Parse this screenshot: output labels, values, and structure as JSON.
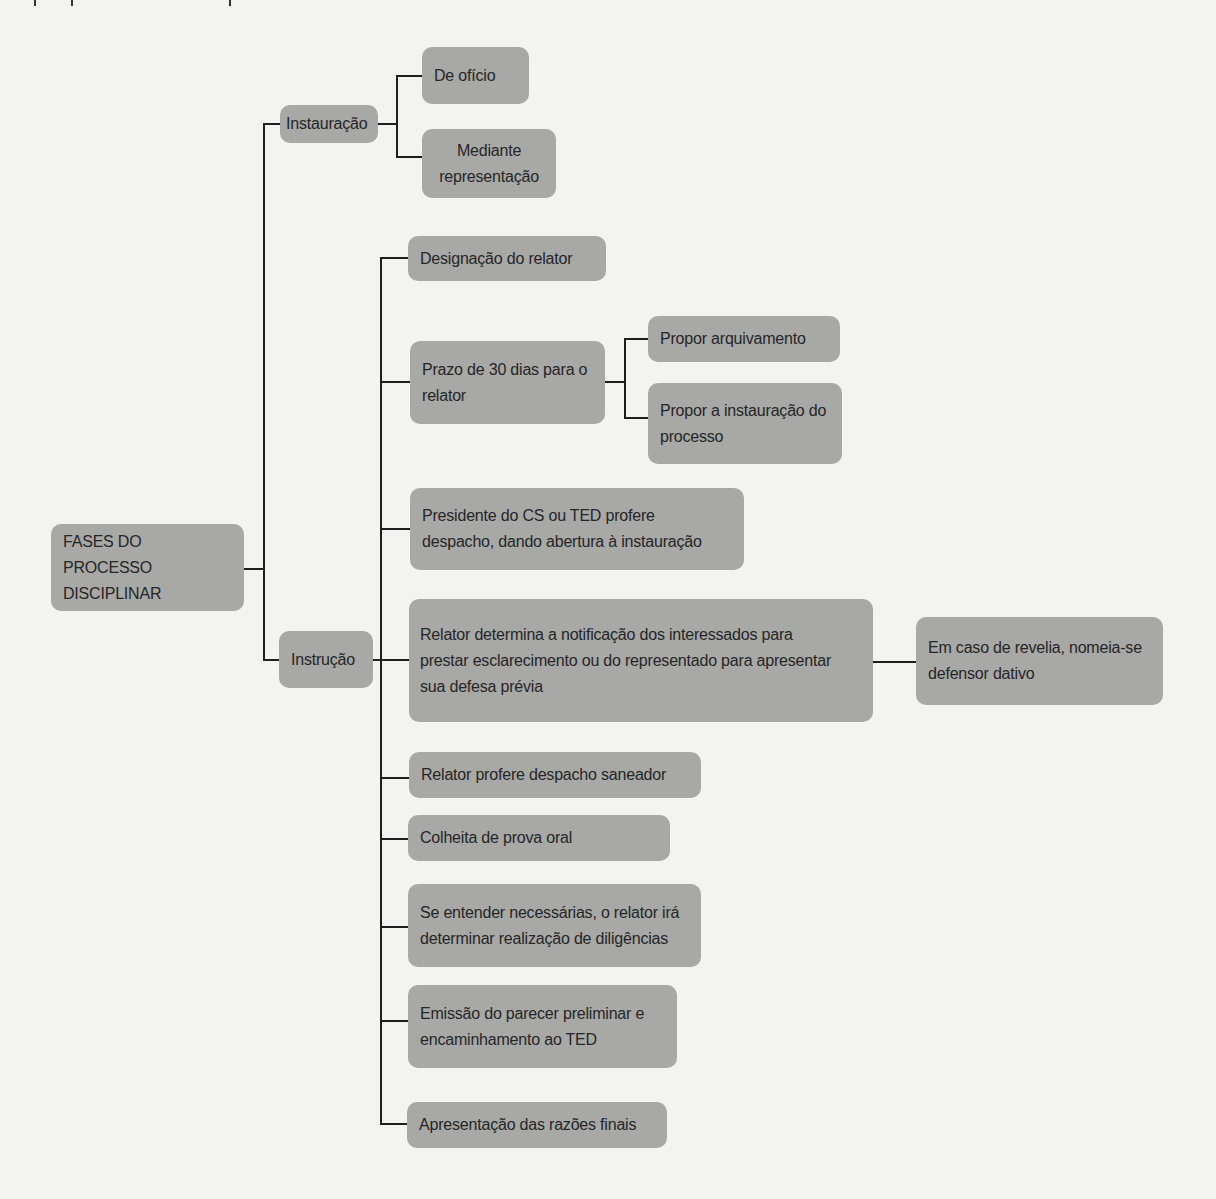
{
  "diagram": {
    "root": {
      "label": "FASES DO PROCESSO DISCIPLINAR",
      "lines": [
        "FASES DO PROCESSO",
        "DISCIPLINAR"
      ]
    },
    "phases": [
      {
        "label": "Instauração",
        "children": [
          {
            "label": "De ofício"
          },
          {
            "label": "Mediante representação",
            "lines": [
              "Mediante",
              "representação"
            ]
          }
        ]
      },
      {
        "label": "Instrução",
        "children": [
          {
            "label": "Designação do relator"
          },
          {
            "label": "Prazo de 30 dias para o relator",
            "lines": [
              "Prazo de 30 dias para o",
              "relator"
            ],
            "children": [
              {
                "label": "Propor arquivamento"
              },
              {
                "label": "Propor a instauração do processo",
                "lines": [
                  "Propor a instauração do",
                  "processo"
                ]
              }
            ]
          },
          {
            "label": "Presidente do CS ou TED profere despacho, dando abertura à instauração",
            "lines": [
              "Presidente do CS ou TED profere",
              "despacho, dando abertura à instauração"
            ]
          },
          {
            "label": "Relator determina a notificação dos interessados para prestar esclarecimento ou do representado para apresentar sua defesa prévia",
            "lines": [
              "Relator determina a notificação dos interessados para",
              "prestar esclarecimento ou do representado para apresentar",
              "sua defesa prévia"
            ],
            "children": [
              {
                "label": "Em caso de revelia, nomeia-se defensor dativo",
                "lines": [
                  "Em caso de revelia, nomeia-se",
                  "defensor dativo"
                ]
              }
            ]
          },
          {
            "label": "Relator profere despacho saneador"
          },
          {
            "label": "Colheita de prova oral"
          },
          {
            "label": "Se entender necessárias, o relator irá determinar realização de diligências",
            "lines": [
              "Se entender necessárias, o relator irá",
              "determinar realização de diligências"
            ]
          },
          {
            "label": "Emissão do parecer preliminar e encaminhamento ao TED",
            "lines": [
              "Emissão do parecer preliminar e",
              "encaminhamento ao TED"
            ]
          },
          {
            "label": "Apresentação das razões finais"
          }
        ]
      }
    ]
  },
  "colors": {
    "node_fill": "#a8a8a6",
    "connector": "#1e1e1e",
    "background": "#f3f3f1",
    "text": "#262626"
  }
}
